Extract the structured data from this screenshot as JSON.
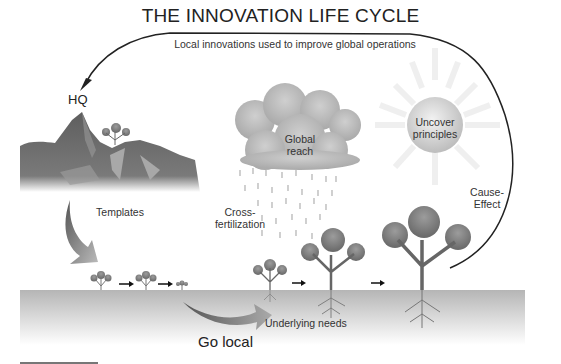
{
  "diagram": {
    "title": "THE INNOVATION LIFE CYCLE",
    "top_arrow_label": "Local innovations used to improve global operations",
    "hq_label": "HQ",
    "cloud_label_line1": "Global",
    "cloud_label_line2": "reach",
    "sun_label_line1": "Uncover",
    "sun_label_line2": "principles",
    "cause_effect_line1": "Cause-",
    "cause_effect_line2": "Effect",
    "templates_label": "Templates",
    "cross_line1": "Cross-",
    "cross_line2": "fertilization",
    "go_local_label": "Go local",
    "underlying_needs_label": "Underlying needs",
    "colors": {
      "ground": "#bdbdbd",
      "mountain": "#6e6e6e",
      "cloud": "#b8b8b8",
      "sun": "#d9d9d9",
      "tree": "#8a8a8a",
      "arrow": "#222222"
    }
  }
}
